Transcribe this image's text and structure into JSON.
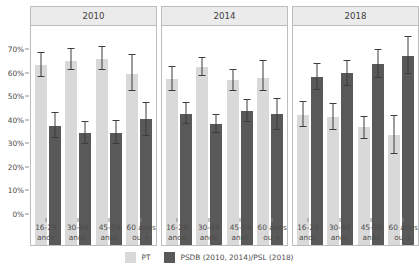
{
  "chart_data": {
    "type": "bar",
    "title": "",
    "subtitle": "",
    "xlabel": "",
    "ylabel": "",
    "ylim": [
      0,
      73
    ],
    "ytick_values": [
      0,
      10,
      20,
      30,
      40,
      50,
      60,
      70
    ],
    "ytick_labels": [
      "0%",
      "10%",
      "20%",
      "30%",
      "40%",
      "50%",
      "60%",
      "70%"
    ],
    "grid": false,
    "legend_position": "bottom",
    "orientation": "vertical",
    "error_bars": true,
    "panel_variable": "year",
    "categories": [
      "16-29 anos",
      "30-44 anos",
      "45-59 anos",
      "60 anos ou +"
    ],
    "category_lines": [
      [
        "16-29",
        "anos"
      ],
      [
        "30-44",
        "anos"
      ],
      [
        "45-59",
        "anos"
      ],
      [
        "60 anos",
        "ou +"
      ]
    ],
    "legend": [
      {
        "name": "PT",
        "color": "#d9d9d9"
      },
      {
        "name": "PSDB (2010, 2014)/PSL (2018)",
        "color": "#595959"
      }
    ],
    "panels": [
      {
        "label": "2010",
        "series": [
          {
            "name": "PT",
            "color": "#d9d9d9",
            "values": [
              60.0,
              61.5,
              62.0,
              57.0
            ],
            "err_low": [
              56.0,
              58.5,
              58.5,
              51.5
            ],
            "err_high": [
              64.0,
              65.5,
              66.0,
              63.5
            ]
          },
          {
            "name": "PSDB (2010, 2014)/PSL (2018)",
            "color": "#595959",
            "values": [
              39.8,
              37.3,
              37.3,
              42.0
            ],
            "err_low": [
              35.8,
              33.8,
              33.8,
              36.5
            ],
            "err_high": [
              44.0,
              41.0,
              41.3,
              47.5
            ]
          }
        ]
      },
      {
        "label": "2014",
        "series": [
          {
            "name": "PT",
            "color": "#d9d9d9",
            "values": [
              55.3,
              59.2,
              55.0,
              55.8
            ],
            "err_low": [
              51.5,
              56.3,
              51.3,
              51.3
            ],
            "err_high": [
              59.3,
              62.3,
              58.5,
              61.3
            ]
          },
          {
            "name": "PSDB (2010, 2014)/PSL (2018)",
            "color": "#595959",
            "values": [
              43.8,
              40.3,
              44.7,
              43.8
            ],
            "err_low": [
              40.5,
              37.3,
              41.0,
              38.3
            ],
            "err_high": [
              47.3,
              43.5,
              48.3,
              48.8
            ]
          }
        ]
      },
      {
        "label": "2018",
        "series": [
          {
            "name": "PT",
            "color": "#d9d9d9",
            "values": [
              43.3,
              42.7,
              39.2,
              36.7
            ],
            "err_low": [
              39.3,
              38.3,
              35.3,
              30.5
            ],
            "err_high": [
              47.8,
              47.0,
              42.8,
              43.0
            ]
          },
          {
            "name": "PSDB (2010, 2014)/PSL (2018)",
            "color": "#595959",
            "values": [
              56.0,
              57.3,
              60.5,
              63.0
            ],
            "err_low": [
              51.8,
              53.0,
              55.8,
              57.0
            ],
            "err_high": [
              60.3,
              61.5,
              65.0,
              69.5
            ]
          }
        ]
      }
    ]
  }
}
